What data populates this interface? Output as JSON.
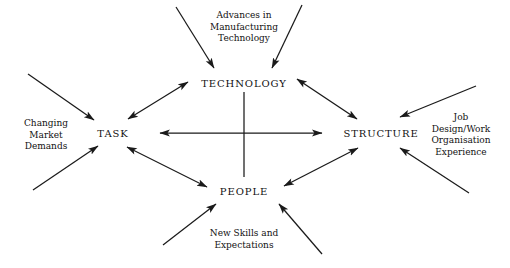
{
  "diagram": {
    "type": "network",
    "stroke_color": "#1a1a1a",
    "background_color": "#ffffff",
    "nodes": [
      {
        "id": "technology",
        "label": "TECHNOLOGY",
        "x": 244,
        "y": 83
      },
      {
        "id": "task",
        "label": "TASK",
        "x": 113,
        "y": 133
      },
      {
        "id": "structure",
        "label": "STRUCTURE",
        "x": 381,
        "y": 133
      },
      {
        "id": "people",
        "label": "PEOPLE",
        "x": 244,
        "y": 191
      }
    ],
    "internal_connections": [
      {
        "from": "task",
        "to": "technology",
        "arrow": "double"
      },
      {
        "from": "technology",
        "to": "structure",
        "arrow": "double"
      },
      {
        "from": "task",
        "to": "people",
        "arrow": "double"
      },
      {
        "from": "people",
        "to": "structure",
        "arrow": "double"
      },
      {
        "from": "task",
        "to": "structure",
        "arrow": "double"
      },
      {
        "from": "technology",
        "to": "people",
        "arrow": "none"
      }
    ],
    "external_labels": [
      {
        "id": "advances",
        "lines": [
          "Advances in",
          "Manufacturing",
          "Technology"
        ],
        "x": 244,
        "y": 27,
        "target": "technology",
        "arrows": 2
      },
      {
        "id": "market",
        "lines": [
          "Changing",
          "Market",
          "Demands"
        ],
        "x": 46,
        "y": 135,
        "target": "task",
        "arrows": 2
      },
      {
        "id": "job",
        "lines": [
          "Job",
          "Design/Work",
          "Organisation",
          "Experience"
        ],
        "x": 461,
        "y": 135,
        "target": "structure",
        "arrows": 2
      },
      {
        "id": "skills",
        "lines": [
          "New Skills and",
          "Expectations"
        ],
        "x": 244,
        "y": 239,
        "target": "people",
        "arrows": 2
      }
    ]
  }
}
